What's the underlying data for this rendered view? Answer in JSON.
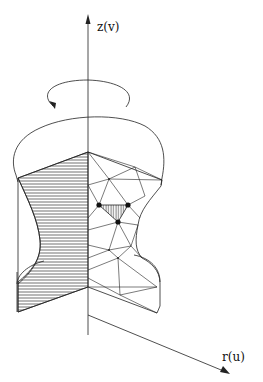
{
  "figure": {
    "axes": {
      "vertical_label": "z(v)",
      "horizontal_label": "r(u)"
    },
    "annotations": {
      "rotation_arrow": "rotation about z-axis",
      "highlighted_element": "hatched triangle element with three node dots"
    },
    "colors": {
      "line": "#222222",
      "background": "#ffffff"
    }
  }
}
